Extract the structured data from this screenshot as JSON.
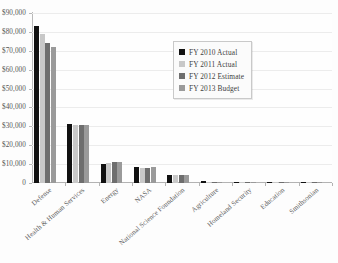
{
  "title_fragment": "",
  "chart_data": {
    "type": "bar",
    "title": "",
    "subtitle": "",
    "xlabel": "",
    "ylabel": "",
    "ylim": [
      0,
      90000
    ],
    "ytick_step": 10000,
    "grid": true,
    "legend_position": "inside-top-right",
    "y_ticks": [
      "$90,000",
      "$80,000",
      "$70,000",
      "$60,000",
      "$50,000",
      "$40,000",
      "$30,000",
      "$20,000",
      "$10,000",
      "0"
    ],
    "y_tick_values": [
      90000,
      80000,
      70000,
      60000,
      50000,
      40000,
      30000,
      20000,
      10000,
      0
    ],
    "categories": [
      "Defense",
      "Health & Human Services",
      "Energy",
      "NASA",
      "National Science Foundation",
      "Agriculture",
      "Homeland Security",
      "Education",
      "Smithsonian"
    ],
    "series": [
      {
        "name": "FY 2010 Actual",
        "color": "#111111",
        "values": [
          83000,
          31200,
          10200,
          8300,
          4300,
          1200,
          400,
          150,
          120
        ]
      },
      {
        "name": "FY 2011 Actual",
        "color": "#c8c8c8",
        "values": [
          79000,
          30600,
          10600,
          8100,
          4100,
          700,
          250,
          130,
          110
        ]
      },
      {
        "name": "FY 2012 Estimate",
        "color": "#6e6e6e",
        "values": [
          74000,
          30500,
          10900,
          8200,
          4300,
          800,
          300,
          140,
          110
        ]
      },
      {
        "name": "FY 2013 Budget",
        "color": "#9a9a9a",
        "values": [
          72000,
          30500,
          11200,
          8600,
          4400,
          800,
          300,
          140,
          110
        ]
      }
    ]
  },
  "legend": {
    "items": [
      {
        "label": "FY 2010 Actual",
        "color": "#111111"
      },
      {
        "label": "FY 2011 Actual",
        "color": "#c8c8c8"
      },
      {
        "label": "FY 2012 Estimate",
        "color": "#6e6e6e"
      },
      {
        "label": "FY 2013 Budget",
        "color": "#9a9a9a"
      }
    ]
  }
}
